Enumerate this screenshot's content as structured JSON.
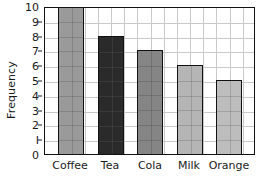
{
  "chart_data": {
    "type": "bar",
    "title": "",
    "xlabel": "",
    "ylabel": "Frequency",
    "categories": [
      "Coffee",
      "Tea",
      "Cola",
      "Milk",
      "Orange"
    ],
    "values": [
      10,
      8,
      7,
      6,
      5
    ],
    "ylim": [
      0,
      10
    ],
    "ytick_labels": [
      "0",
      "I",
      "2",
      "3",
      "4",
      "5",
      "6",
      "7",
      "8",
      "9",
      "10"
    ],
    "ytick_values": [
      0,
      1,
      2,
      3,
      4,
      5,
      6,
      7,
      8,
      9,
      10
    ],
    "grid": "both",
    "legend": "none",
    "bar_colors": [
      "#9a9a9a",
      "#2a2a2a",
      "#858585",
      "#b5b5b5",
      "#bdbdbd"
    ],
    "bar_edge_color": "#111111",
    "grid_color": "#c9c9c9",
    "axis_color": "#111111",
    "background_color": "#ffffff"
  }
}
